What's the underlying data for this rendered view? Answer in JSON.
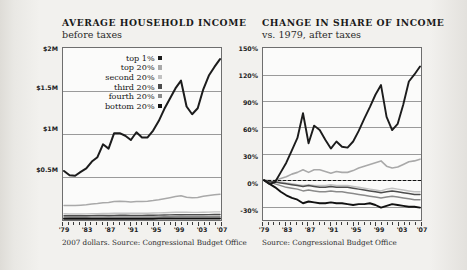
{
  "figure": {
    "background": "#f2f1ee",
    "series_colors": {
      "top1": "#1c1c1c",
      "top20": "#a9a9a9",
      "second20": "#c2c2c2",
      "third20": "#4d4d4d",
      "fourth20": "#8a8a8a",
      "bottom20": "#111111"
    }
  },
  "left": {
    "title": "AVERAGE HOUSEHOLD INCOME",
    "subtitle": "before taxes",
    "source": "2007 dollars. Source: Congressional Budget Office",
    "legend": [
      {
        "label": "top 1%",
        "color": "#1c1c1c"
      },
      {
        "label": "top 20%",
        "color": "#a9a9a9"
      },
      {
        "label": "second 20%",
        "color": "#c2c2c2"
      },
      {
        "label": "third 20%",
        "color": "#4d4d4d"
      },
      {
        "label": "fourth 20%",
        "color": "#8a8a8a"
      },
      {
        "label": "bottom 20%",
        "color": "#111111"
      }
    ]
  },
  "right": {
    "title": "CHANGE IN SHARE OF INCOME",
    "subtitle": "vs. 1979, after taxes",
    "source": "Source: Congressional Budget Office"
  },
  "chart_data": [
    {
      "type": "line",
      "id": "average-household-income",
      "title": "AVERAGE HOUSEHOLD INCOME",
      "subtitle": "before taxes",
      "xlabel": "",
      "ylabel": "",
      "grid": true,
      "legend_position": "inside-top-left",
      "source": "2007 dollars. Source: Congressional Budget Office",
      "x": [
        1979,
        1980,
        1981,
        1982,
        1983,
        1984,
        1985,
        1986,
        1987,
        1988,
        1989,
        1990,
        1991,
        1992,
        1993,
        1994,
        1995,
        1996,
        1997,
        1998,
        1999,
        2000,
        2001,
        2002,
        2003,
        2004,
        2005,
        2006,
        2007
      ],
      "xticklabels": [
        "'79",
        "'83",
        "'87",
        "'91",
        "'95",
        "'99",
        "'03",
        "'07"
      ],
      "xtickvalues": [
        1979,
        1983,
        1987,
        1991,
        1995,
        1999,
        2003,
        2007
      ],
      "ylim": [
        0,
        2000000
      ],
      "yticklabels": [
        "$0.5M",
        "$1M",
        "$1.5M",
        "$2M"
      ],
      "ytickvalues": [
        500000,
        1000000,
        1500000,
        2000000
      ],
      "series": [
        {
          "name": "top 1%",
          "color": "#1c1c1c",
          "values": [
            570000,
            520000,
            515000,
            560000,
            600000,
            680000,
            730000,
            880000,
            830000,
            1010000,
            1010000,
            980000,
            930000,
            1020000,
            960000,
            960000,
            1040000,
            1150000,
            1290000,
            1410000,
            1530000,
            1620000,
            1320000,
            1230000,
            1300000,
            1520000,
            1680000,
            1780000,
            1870000
          ]
        },
        {
          "name": "top 20%",
          "color": "#a9a9a9",
          "values": [
            170000,
            168000,
            168000,
            172000,
            176000,
            186000,
            192000,
            200000,
            204000,
            214000,
            218000,
            214000,
            210000,
            214000,
            214000,
            218000,
            226000,
            236000,
            248000,
            260000,
            272000,
            282000,
            264000,
            258000,
            262000,
            276000,
            286000,
            294000,
            300000
          ]
        },
        {
          "name": "second 20%",
          "color": "#c2c2c2",
          "values": [
            72000,
            70000,
            70000,
            70000,
            71000,
            73000,
            74000,
            76000,
            77000,
            79000,
            80000,
            79000,
            78000,
            78000,
            78000,
            79000,
            81000,
            83000,
            85000,
            88000,
            90000,
            92000,
            90000,
            89000,
            89000,
            90000,
            92000,
            94000,
            95000
          ]
        },
        {
          "name": "third 20%",
          "color": "#4d4d4d",
          "values": [
            50000,
            49000,
            49000,
            49000,
            49500,
            51000,
            51500,
            52500,
            53000,
            54000,
            55000,
            54500,
            54000,
            54000,
            54000,
            54500,
            55500,
            57000,
            58000,
            60000,
            61500,
            62500,
            61500,
            61000,
            61000,
            61500,
            62500,
            63500,
            64500
          ]
        },
        {
          "name": "fourth 20%",
          "color": "#8a8a8a",
          "values": [
            33000,
            32000,
            32000,
            32000,
            32500,
            33000,
            33500,
            34000,
            34500,
            35000,
            35500,
            35000,
            34500,
            34500,
            34500,
            35000,
            35500,
            36500,
            37500,
            38500,
            39500,
            40000,
            39500,
            39000,
            39000,
            39500,
            40000,
            40500,
            41000
          ]
        },
        {
          "name": "bottom 20%",
          "color": "#111111",
          "values": [
            15500,
            15000,
            14800,
            14500,
            14500,
            14800,
            15000,
            15200,
            15400,
            15600,
            15800,
            15600,
            15300,
            15200,
            15200,
            15400,
            15600,
            16000,
            16400,
            17000,
            17400,
            17600,
            17400,
            17200,
            17100,
            17200,
            17400,
            17600,
            17800
          ]
        }
      ]
    },
    {
      "type": "line",
      "id": "change-in-share-of-income",
      "title": "CHANGE IN SHARE OF INCOME",
      "subtitle": "vs. 1979, after taxes",
      "xlabel": "",
      "ylabel": "",
      "grid": true,
      "legend_position": "none",
      "source": "Source: Congressional Budget Office",
      "zero_reference_line": 0,
      "x": [
        1979,
        1980,
        1981,
        1982,
        1983,
        1984,
        1985,
        1986,
        1987,
        1988,
        1989,
        1990,
        1991,
        1992,
        1993,
        1994,
        1995,
        1996,
        1997,
        1998,
        1999,
        2000,
        2001,
        2002,
        2003,
        2004,
        2005,
        2006,
        2007
      ],
      "xticklabels": [
        "'79",
        "'83",
        "'87",
        "'91",
        "'95",
        "'99",
        "'03",
        "'07"
      ],
      "xtickvalues": [
        1979,
        1983,
        1987,
        1991,
        1995,
        1999,
        2003,
        2007
      ],
      "ylim": [
        -45,
        150
      ],
      "yticklabels": [
        "-30%",
        "0%",
        "30%",
        "60%",
        "90%",
        "120%",
        "150%"
      ],
      "ytickvalues": [
        -30,
        0,
        30,
        60,
        90,
        120,
        150
      ],
      "series": [
        {
          "name": "top 1%",
          "color": "#1c1c1c",
          "values": [
            0,
            -4,
            -2,
            9,
            20,
            34,
            48,
            76,
            42,
            62,
            57,
            46,
            36,
            44,
            38,
            37,
            44,
            56,
            70,
            83,
            97,
            108,
            72,
            57,
            64,
            86,
            112,
            120,
            129
          ]
        },
        {
          "name": "top 20%",
          "color": "#a9a9a9",
          "values": [
            0,
            -1,
            0,
            2,
            4,
            7,
            9,
            12,
            9,
            12,
            12,
            10,
            8,
            10,
            9,
            9,
            11,
            14,
            16,
            18,
            20,
            22,
            16,
            14,
            15,
            18,
            21,
            22,
            24
          ]
        },
        {
          "name": "second 20%",
          "color": "#c2c2c2",
          "values": [
            0,
            0,
            -1,
            -2,
            -3,
            -4,
            -5,
            -6,
            -5,
            -6,
            -6,
            -6,
            -5,
            -6,
            -6,
            -6,
            -7,
            -8,
            -9,
            -10,
            -11,
            -12,
            -10,
            -9,
            -10,
            -11,
            -12,
            -13,
            -13
          ]
        },
        {
          "name": "third 20%",
          "color": "#4d4d4d",
          "values": [
            0,
            -1,
            -2,
            -3,
            -4,
            -5,
            -6,
            -7,
            -6,
            -7,
            -8,
            -8,
            -7,
            -8,
            -8,
            -8,
            -9,
            -10,
            -11,
            -12,
            -13,
            -14,
            -13,
            -12,
            -13,
            -14,
            -15,
            -16,
            -16
          ]
        },
        {
          "name": "fourth 20%",
          "color": "#8a8a8a",
          "values": [
            0,
            -2,
            -4,
            -6,
            -8,
            -9,
            -10,
            -12,
            -11,
            -12,
            -13,
            -13,
            -12,
            -13,
            -13,
            -14,
            -15,
            -16,
            -17,
            -18,
            -19,
            -20,
            -19,
            -18,
            -19,
            -20,
            -21,
            -22,
            -22
          ]
        },
        {
          "name": "bottom 20%",
          "color": "#111111",
          "values": [
            0,
            -4,
            -8,
            -13,
            -17,
            -20,
            -22,
            -26,
            -24,
            -25,
            -26,
            -26,
            -25,
            -26,
            -26,
            -27,
            -28,
            -27,
            -27,
            -26,
            -28,
            -31,
            -29,
            -27,
            -28,
            -29,
            -30,
            -30,
            -31
          ]
        }
      ]
    }
  ]
}
